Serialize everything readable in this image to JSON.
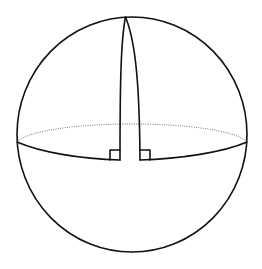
{
  "diagram": {
    "colors": {
      "background": "#ffffff",
      "stroke": "#111111",
      "hidden_edge": "#777777"
    },
    "sphere": {
      "cx": 132,
      "cy": 134.5,
      "r": 116
    },
    "equator": {
      "front": "solid",
      "back": "dotted"
    },
    "meridians": [
      {
        "name": "left-meridian",
        "base_x": 120,
        "base_y": 160
      },
      {
        "name": "right-meridian",
        "base_x": 140,
        "base_y": 160
      }
    ],
    "right_angle_markers": [
      {
        "name": "left-right-angle",
        "x": 110,
        "y": 150,
        "size": 10
      },
      {
        "name": "right-right-angle",
        "x": 140,
        "y": 150,
        "size": 10
      }
    ],
    "labels": []
  }
}
